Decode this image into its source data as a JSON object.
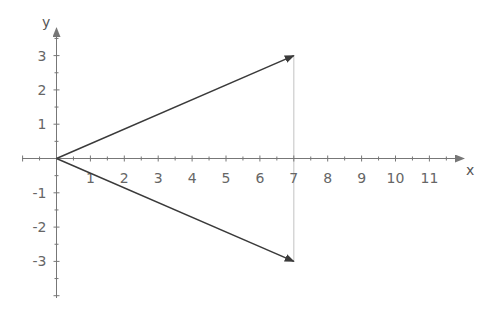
{
  "chart_data": {
    "type": "line",
    "title": "",
    "xlabel": "x",
    "ylabel": "y",
    "xlim": [
      -1,
      12
    ],
    "ylim": [
      -4,
      3.8
    ],
    "x_ticks": [
      "1",
      "2",
      "3",
      "4",
      "5",
      "6",
      "7",
      "8",
      "9",
      "10",
      "11"
    ],
    "y_ticks": [
      "3",
      "2",
      "1",
      "-1",
      "-2",
      "-3"
    ],
    "grid": false,
    "series": [
      {
        "name": "vector-upper",
        "kind": "arrow",
        "from": [
          0,
          0
        ],
        "to": [
          7,
          3
        ],
        "color": "#3a3a3a"
      },
      {
        "name": "vector-lower",
        "kind": "arrow",
        "from": [
          0,
          0
        ],
        "to": [
          7,
          -3
        ],
        "color": "#3a3a3a"
      },
      {
        "name": "connector",
        "kind": "segment",
        "from": [
          7,
          3
        ],
        "to": [
          7,
          -3
        ],
        "color": "#cccccc"
      }
    ]
  },
  "colors": {
    "axis": "#777777",
    "vector": "#3a3a3a",
    "connector": "#cccccc",
    "text": "#666666"
  }
}
